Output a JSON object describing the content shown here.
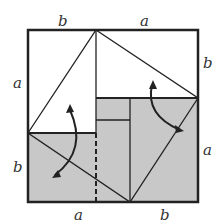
{
  "labels": {
    "top_left": "b",
    "top_right": "a",
    "left_top": "a",
    "left_bottom": "b",
    "right_top": "b",
    "right_bottom": "a",
    "bottom_left": "a",
    "bottom_right": "b"
  },
  "colors": {
    "shade": "#c8c8c8",
    "line": "#222222"
  }
}
